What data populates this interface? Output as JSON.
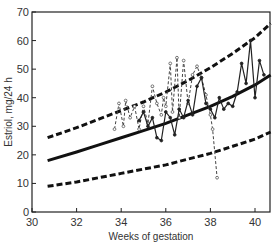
{
  "chart_data": {
    "type": "line",
    "title": "",
    "xlabel": "Weeks of gestation",
    "ylabel": "Estriol, mg/24 h",
    "xlim": [
      30,
      40.7
    ],
    "ylim": [
      0,
      70
    ],
    "xticks": [
      30,
      32,
      34,
      36,
      38,
      40
    ],
    "yticks": [
      0,
      10,
      20,
      30,
      40,
      50,
      60,
      70
    ],
    "grid": false,
    "legend": null,
    "series": [
      {
        "name": "Upper limit (dashed)",
        "style": "thick-dashed",
        "x": [
          30.7,
          32,
          33,
          34,
          35,
          36,
          37,
          38,
          39,
          40,
          40.7
        ],
        "y": [
          26,
          29.5,
          32.5,
          35.5,
          38.5,
          42,
          46,
          50.5,
          55.5,
          61,
          66
        ]
      },
      {
        "name": "Mean (solid)",
        "style": "thick-solid",
        "x": [
          30.7,
          32,
          33,
          34,
          35,
          36,
          37,
          38,
          39,
          40,
          40.7
        ],
        "y": [
          18,
          21,
          23.5,
          26,
          28.5,
          31,
          34,
          37,
          40.5,
          44.5,
          48
        ]
      },
      {
        "name": "Lower limit (dashed)",
        "style": "thick-dashed",
        "x": [
          30.7,
          32,
          33,
          34,
          35,
          36,
          37,
          38,
          39,
          40,
          40.7
        ],
        "y": [
          9,
          10.5,
          12,
          13.5,
          15,
          16.5,
          18.5,
          20.5,
          23,
          25.5,
          28
        ]
      },
      {
        "name": "Patient A (dashed, open markers)",
        "style": "thin-dashed",
        "x": [
          33.7,
          33.9,
          34.1,
          34.2,
          34.4,
          34.6,
          34.8,
          35.0,
          35.2,
          35.4,
          35.6,
          35.8,
          35.9,
          36.0,
          36.2,
          36.3,
          36.5,
          36.6,
          36.8,
          37.0,
          37.2,
          37.4,
          37.6,
          37.8,
          38.0,
          38.1,
          38.3
        ],
        "y": [
          29,
          38,
          30,
          39,
          33,
          37,
          29,
          37,
          31,
          44,
          38,
          34,
          40,
          37,
          52,
          35,
          54,
          33,
          53,
          38,
          48,
          51,
          47,
          41,
          34,
          29,
          12
        ]
      },
      {
        "name": "Patient B (solid, filled markers)",
        "style": "thin-solid",
        "x": [
          34.8,
          35.0,
          35.2,
          35.4,
          35.6,
          35.8,
          36.0,
          36.2,
          36.4,
          36.6,
          36.8,
          37.0,
          37.2,
          37.4,
          37.6,
          37.8,
          38.0,
          38.2,
          38.4,
          38.6,
          38.8,
          39.0,
          39.2,
          39.4,
          39.6,
          39.8,
          40.0,
          40.2,
          40.4
        ],
        "y": [
          32,
          35,
          30,
          33,
          26,
          25,
          35,
          33,
          27,
          36,
          33,
          39,
          34,
          44,
          47,
          38,
          36,
          33,
          40,
          36,
          38,
          37,
          42,
          52,
          45,
          60,
          40,
          53,
          48
        ]
      }
    ]
  }
}
